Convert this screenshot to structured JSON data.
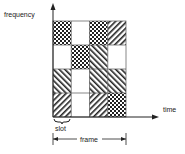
{
  "diagram": {
    "y_axis_label": "frequency",
    "x_axis_label": "time",
    "slot_label": "slot",
    "frame_label": "frame",
    "grid": {
      "rows": 4,
      "cols": 4,
      "cells": [
        [
          "checker",
          "empty",
          "checker",
          "forward-hatch"
        ],
        [
          "empty",
          "checker",
          "back-hatch",
          "empty"
        ],
        [
          "back-hatch",
          "empty",
          "back-hatch",
          "back-hatch"
        ],
        [
          "forward-hatch",
          "empty",
          "forward-hatch",
          "checker"
        ]
      ]
    },
    "colors": {
      "ink": "#222222",
      "background": "#ffffff"
    }
  }
}
